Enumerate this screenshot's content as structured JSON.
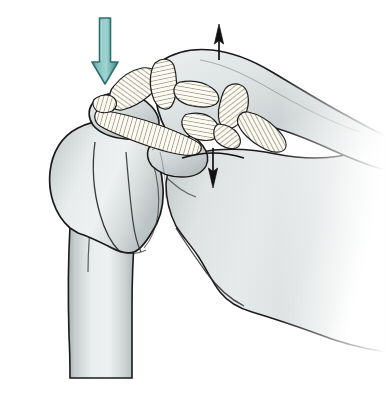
{
  "figure": {
    "view": "anterior coronal",
    "background_color": "#ffffff",
    "width": 386,
    "height": 415
  },
  "palette": {
    "bone_light": "#f2f4f4",
    "bone_mid": "#d8dcdc",
    "bone_shadow": "#b9bfc0",
    "bone_deep_shadow": "#a2a9ab",
    "outline": "#161616",
    "ligament_fill": "#fbfbf7",
    "ligament_hatch": "#8d8362",
    "ligament_hatch_dark": "#6d6444",
    "teal_arrow_fill": "#6fb3b0",
    "teal_arrow_light": "#9fd0ce",
    "teal_arrow_dark": "#2f6f70",
    "black_arrow": "#111111"
  },
  "arrows": {
    "compression_arrow": {
      "name": "downward compression force arrow",
      "color": "#6fb3b0",
      "outline_color": "#2f6f70",
      "direction": "down",
      "x": 105,
      "y_start": 18,
      "y_end": 82,
      "shaft_width": 11,
      "head_width": 26,
      "head_length": 20,
      "meaning": "downward compressive load on acromion"
    },
    "superior_arrow": {
      "name": "upward translation arrow",
      "color": "#111111",
      "direction": "up",
      "x": 219,
      "y_start": 58,
      "y_end": 26,
      "shaft_width": 1.6,
      "head_width": 9,
      "head_length": 17,
      "meaning": "superior displacement of clavicle"
    },
    "inferior_arrow": {
      "name": "downward translation arrow",
      "color": "#111111",
      "direction": "down",
      "x": 213,
      "y_start": 150,
      "y_end": 186,
      "shaft_width": 1.6,
      "head_width": 9,
      "head_length": 17,
      "crossbar": true,
      "crossbar_y": 157,
      "crossbar_x_start": 182,
      "crossbar_x_end": 243,
      "meaning": "inferior displacement of scapula"
    }
  },
  "structures": [
    {
      "id": "humerus",
      "name": "humerus",
      "label": "Humerus (head, greater tuberosity and shaft)",
      "fill": "#e4e8e8",
      "region": "left"
    },
    {
      "id": "humeral-head",
      "name": "humeral-head",
      "label": "Humeral head",
      "fill": "#e1e5e6",
      "region": "left-superior"
    },
    {
      "id": "greater-tuberosity",
      "name": "greater-tuberosity",
      "label": "Greater tuberosity",
      "fill": "#dadfe0",
      "region": "left-lateral"
    },
    {
      "id": "acromion",
      "name": "acromion",
      "label": "Acromion process",
      "fill": "#d5dada",
      "region": "superior-left"
    },
    {
      "id": "clavicle",
      "name": "clavicle",
      "label": "Clavicle",
      "fill": "#dde1e2",
      "region": "superior-right"
    },
    {
      "id": "scapula",
      "name": "scapula",
      "label": "Scapula body and glenoid",
      "fill": "#dcdfe0",
      "region": "right"
    },
    {
      "id": "coracoid",
      "name": "coracoid-process",
      "label": "Coracoid process",
      "fill": "#d7dcdc",
      "region": "center"
    }
  ],
  "ligaments": [
    {
      "id": "coracoacromial",
      "name": "coracoacromial-ligament",
      "label": "Coracoacromial ligament",
      "hatch_color": "#8d8362",
      "hatch_count": 16
    },
    {
      "id": "acromioclavicular",
      "name": "acromioclavicular-ligament",
      "label": "Acromioclavicular ligament",
      "hatch_color": "#8d8362",
      "hatch_count": 12
    },
    {
      "id": "conoid",
      "name": "conoid-ligament",
      "label": "Conoid ligament",
      "hatch_color": "#8d8362",
      "hatch_count": 13
    },
    {
      "id": "trapezoid",
      "name": "trapezoid-ligament",
      "label": "Trapezoid ligament",
      "hatch_color": "#8d8362",
      "hatch_count": 14
    },
    {
      "id": "superior-transverse",
      "name": "superior-transverse-scapular-ligament",
      "label": "Superior transverse scapular ligament",
      "hatch_color": "#8d8362",
      "hatch_count": 12
    },
    {
      "id": "coracohumeral",
      "name": "coracohumeral-ligament",
      "label": "Coracohumeral ligament band",
      "hatch_color": "#8d8362",
      "hatch_count": 18
    }
  ],
  "labels": {
    "none_visible": ""
  }
}
